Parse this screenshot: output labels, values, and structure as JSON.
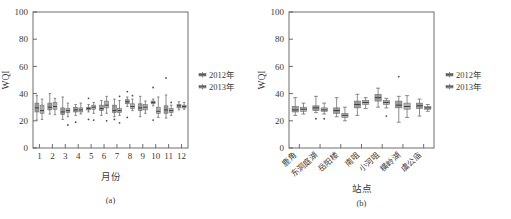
{
  "figure": {
    "panels": [
      {
        "id": "a",
        "caption": "(a)",
        "ylabel": "WQI",
        "xlabel": "月份",
        "legend": [
          "2012年",
          "2013年"
        ]
      },
      {
        "id": "b",
        "caption": "(b)",
        "ylabel": "WQI",
        "xlabel": "站点",
        "legend": [
          "2012年",
          "2013年"
        ]
      }
    ],
    "colors": {
      "series_2012": "#8d8d8d",
      "series_2013": "#a8a8a8",
      "axis": "#4a4a4a",
      "outlier": "#4a4a4a",
      "background": "#ffffff"
    }
  },
  "chart_data": [
    {
      "type": "box",
      "panel": "(a)",
      "title": "",
      "xlabel": "月份",
      "ylabel": "WQI",
      "ylim": [
        0,
        100
      ],
      "yticks": [
        0,
        20,
        40,
        60,
        80,
        100
      ],
      "grid": false,
      "legend_position": "right",
      "categories": [
        "1",
        "2",
        "3",
        "4",
        "5",
        "6",
        "7",
        "8",
        "9",
        "10",
        "11",
        "12"
      ],
      "series": [
        {
          "name": "2012年",
          "boxes": [
            {
              "category": "1",
              "min": 20.5,
              "q1": 26.5,
              "median": 29.5,
              "q3": 33.0,
              "max": 38.5,
              "outliers": []
            },
            {
              "category": "2",
              "min": 25.0,
              "q1": 28.0,
              "median": 30.0,
              "q3": 33.0,
              "max": 40.0,
              "outliers": []
            },
            {
              "category": "3",
              "min": 21.0,
              "q1": 24.5,
              "median": 26.5,
              "q3": 29.5,
              "max": 37.5,
              "outliers": []
            },
            {
              "category": "4",
              "min": 24.0,
              "q1": 26.5,
              "median": 28.0,
              "q3": 30.0,
              "max": 32.0,
              "outliers": [
                19.0
              ]
            },
            {
              "category": "5",
              "min": 26.5,
              "q1": 28.0,
              "median": 29.0,
              "q3": 30.0,
              "max": 32.0,
              "outliers": [
                36.5,
                21.0
              ]
            },
            {
              "category": "6",
              "min": 24.0,
              "q1": 27.5,
              "median": 29.0,
              "q3": 31.5,
              "max": 35.0,
              "outliers": []
            },
            {
              "category": "7",
              "min": 23.0,
              "q1": 26.0,
              "median": 27.5,
              "q3": 31.5,
              "max": 36.0,
              "outliers": [
                21.0
              ]
            },
            {
              "category": "8",
              "min": 30.5,
              "q1": 32.5,
              "median": 34.0,
              "q3": 35.5,
              "max": 37.5,
              "outliers": [
                41.5,
                22.5
              ]
            },
            {
              "category": "9",
              "min": 23.0,
              "q1": 27.5,
              "median": 29.5,
              "q3": 32.5,
              "max": 38.0,
              "outliers": []
            },
            {
              "category": "10",
              "min": 31.0,
              "q1": 32.5,
              "median": 33.5,
              "q3": 34.5,
              "max": 36.0,
              "outliers": [
                44.5,
                20.5
              ]
            },
            {
              "category": "11",
              "min": 22.0,
              "q1": 25.5,
              "median": 28.0,
              "q3": 31.0,
              "max": 39.0,
              "outliers": [
                51.5
              ]
            },
            {
              "category": "12",
              "min": 28.0,
              "q1": 29.5,
              "median": 31.0,
              "q3": 32.0,
              "max": 34.0,
              "outliers": []
            }
          ]
        },
        {
          "name": "2013年",
          "boxes": [
            {
              "category": "1",
              "min": 21.0,
              "q1": 25.5,
              "median": 27.5,
              "q3": 31.5,
              "max": 36.0,
              "outliers": []
            },
            {
              "category": "2",
              "min": 24.5,
              "q1": 28.5,
              "median": 30.5,
              "q3": 33.5,
              "max": 36.5,
              "outliers": []
            },
            {
              "category": "3",
              "min": 23.0,
              "q1": 26.0,
              "median": 27.5,
              "q3": 29.0,
              "max": 33.0,
              "outliers": [
                17.0
              ]
            },
            {
              "category": "4",
              "min": 25.0,
              "q1": 26.5,
              "median": 28.0,
              "q3": 29.5,
              "max": 33.0,
              "outliers": []
            },
            {
              "category": "5",
              "min": 25.5,
              "q1": 28.5,
              "median": 30.0,
              "q3": 31.5,
              "max": 33.5,
              "outliers": [
                20.5
              ]
            },
            {
              "category": "6",
              "min": 25.5,
              "q1": 29.5,
              "median": 31.5,
              "q3": 34.5,
              "max": 38.0,
              "outliers": [
                20.0
              ]
            },
            {
              "category": "7",
              "min": 24.0,
              "q1": 26.0,
              "median": 27.5,
              "q3": 29.0,
              "max": 35.0,
              "outliers": [
                38.0,
                18.5
              ]
            },
            {
              "category": "8",
              "min": 27.5,
              "q1": 29.0,
              "median": 30.5,
              "q3": 32.5,
              "max": 36.0,
              "outliers": [
                38.5
              ]
            },
            {
              "category": "9",
              "min": 25.5,
              "q1": 28.0,
              "median": 30.0,
              "q3": 32.0,
              "max": 34.5,
              "outliers": []
            },
            {
              "category": "10",
              "min": 22.5,
              "q1": 25.5,
              "median": 27.0,
              "q3": 30.0,
              "max": 37.5,
              "outliers": []
            },
            {
              "category": "11",
              "min": 24.0,
              "q1": 26.0,
              "median": 27.5,
              "q3": 29.0,
              "max": 31.5,
              "outliers": [
                33.5
              ]
            },
            {
              "category": "12",
              "min": 28.5,
              "q1": 29.5,
              "median": 30.5,
              "q3": 31.5,
              "max": 33.5,
              "outliers": []
            }
          ]
        }
      ]
    },
    {
      "type": "box",
      "panel": "(b)",
      "title": "",
      "xlabel": "站点",
      "ylabel": "WQI",
      "ylim": [
        0,
        100
      ],
      "yticks": [
        0,
        20,
        40,
        60,
        80,
        100
      ],
      "grid": false,
      "legend_position": "right",
      "categories": [
        "鹿角",
        "东洞庭湖",
        "岳阳楼",
        "南咀",
        "小河咀",
        "横岭湖",
        "虞公庙"
      ],
      "series": [
        {
          "name": "2012年",
          "boxes": [
            {
              "category": "鹿角",
              "min": 24.0,
              "q1": 26.5,
              "median": 28.0,
              "q3": 30.5,
              "max": 37.0,
              "outliers": []
            },
            {
              "category": "东洞庭湖",
              "min": 26.0,
              "q1": 27.5,
              "median": 29.5,
              "q3": 31.0,
              "max": 38.0,
              "outliers": [
                21.5
              ]
            },
            {
              "category": "岳阳楼",
              "min": 23.0,
              "q1": 25.5,
              "median": 27.5,
              "q3": 29.5,
              "max": 37.0,
              "outliers": []
            },
            {
              "category": "南咀",
              "min": 24.0,
              "q1": 29.5,
              "median": 32.0,
              "q3": 34.5,
              "max": 39.5,
              "outliers": []
            },
            {
              "category": "小河咀",
              "min": 30.0,
              "q1": 34.5,
              "median": 37.0,
              "q3": 39.5,
              "max": 44.0,
              "outliers": []
            },
            {
              "category": "横岭湖",
              "min": 19.0,
              "q1": 29.5,
              "median": 31.5,
              "q3": 34.5,
              "max": 38.0,
              "outliers": [
                52.5
              ]
            },
            {
              "category": "虞公庙",
              "min": 23.5,
              "q1": 29.0,
              "median": 31.0,
              "q3": 33.0,
              "max": 36.0,
              "outliers": []
            }
          ]
        },
        {
          "name": "2013年",
          "boxes": [
            {
              "category": "鹿角",
              "min": 25.0,
              "q1": 27.0,
              "median": 28.5,
              "q3": 30.0,
              "max": 33.0,
              "outliers": []
            },
            {
              "category": "东洞庭湖",
              "min": 25.0,
              "q1": 27.0,
              "median": 28.0,
              "q3": 29.5,
              "max": 33.0,
              "outliers": [
                21.5
              ]
            },
            {
              "category": "岳阳楼",
              "min": 20.0,
              "q1": 22.5,
              "median": 24.0,
              "q3": 25.5,
              "max": 30.0,
              "outliers": []
            },
            {
              "category": "南咀",
              "min": 29.0,
              "q1": 32.0,
              "median": 33.5,
              "q3": 35.0,
              "max": 37.0,
              "outliers": []
            },
            {
              "category": "小河咀",
              "min": 29.5,
              "q1": 32.0,
              "median": 33.5,
              "q3": 35.0,
              "max": 36.5,
              "outliers": [
                23.5
              ]
            },
            {
              "category": "横岭湖",
              "min": 22.5,
              "q1": 28.5,
              "median": 30.5,
              "q3": 33.0,
              "max": 38.5,
              "outliers": []
            },
            {
              "category": "虞公庙",
              "min": 27.0,
              "q1": 28.5,
              "median": 29.5,
              "q3": 30.5,
              "max": 32.0,
              "outliers": []
            }
          ]
        }
      ]
    }
  ]
}
